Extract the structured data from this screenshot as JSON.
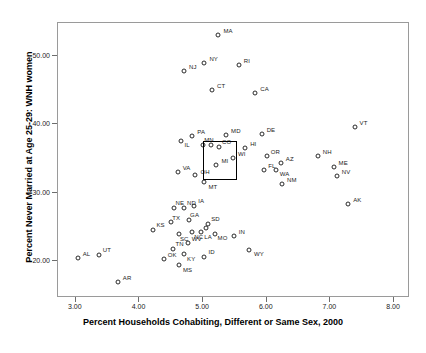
{
  "chart_data": {
    "type": "scatter",
    "title": "",
    "xlabel": "Percent Households Cohabiting, Different or Same Sex, 2000",
    "ylabel": "Percent Never Married at Age 25-29: WNH women",
    "xlim": [
      2.72,
      8.25
    ],
    "ylim": [
      14.6,
      54.8
    ],
    "xticks": [
      "3.00",
      "4.00",
      "5.00",
      "6.00",
      "7.00",
      "8.00"
    ],
    "xtickvalues": [
      3.0,
      4.0,
      5.0,
      6.0,
      7.0,
      8.0
    ],
    "yticks": [
      "20.00",
      "30.00",
      "40.00",
      "50.00"
    ],
    "ytickvalues": [
      20.0,
      30.0,
      40.0,
      50.0
    ],
    "grid": false,
    "legend": null,
    "marker": "open-circle",
    "annotation_box": {
      "label": "highlight-box",
      "x0": 5.0,
      "x1": 5.54,
      "y0": 31.9,
      "y1": 37.6
    },
    "points": [
      {
        "label": "MA",
        "x": 5.24,
        "y": 53.0,
        "lx": 3,
        "ly": -4
      },
      {
        "label": "NY",
        "x": 5.02,
        "y": 49.0,
        "lx": 3,
        "ly": -4
      },
      {
        "label": "NJ",
        "x": 4.7,
        "y": 47.8,
        "lx": 3,
        "ly": -4
      },
      {
        "label": "RI",
        "x": 5.56,
        "y": 48.6,
        "lx": 3,
        "ly": -4
      },
      {
        "label": "CT",
        "x": 5.14,
        "y": 45.0,
        "lx": 3,
        "ly": -4
      },
      {
        "label": "CA",
        "x": 5.82,
        "y": 44.5,
        "lx": 3,
        "ly": -4
      },
      {
        "label": "VT",
        "x": 7.38,
        "y": 39.6,
        "lx": 3,
        "ly": -4
      },
      {
        "label": "PA",
        "x": 4.83,
        "y": 38.3,
        "lx": 3,
        "ly": -4
      },
      {
        "label": "IL",
        "x": 4.66,
        "y": 37.6,
        "lx": 1,
        "ly": 4
      },
      {
        "label": "MD",
        "x": 5.36,
        "y": 38.4,
        "lx": 3,
        "ly": -4
      },
      {
        "label": "DE",
        "x": 5.92,
        "y": 38.6,
        "lx": 3,
        "ly": -4
      },
      {
        "label": "HI",
        "x": 5.66,
        "y": 36.6,
        "lx": 3,
        "ly": -4
      },
      {
        "label": "MN",
        "x": 5.0,
        "y": 36.9,
        "lx": -1,
        "ly": -5
      },
      {
        "label": "CO",
        "x": 5.25,
        "y": 36.7,
        "lx": 1,
        "ly": -5
      },
      {
        "label": "",
        "x": 5.12,
        "y": 37.0,
        "lx": 0,
        "ly": 0
      },
      {
        "label": "WI",
        "x": 5.47,
        "y": 35.1,
        "lx": 3,
        "ly": -4
      },
      {
        "label": "OR",
        "x": 6.0,
        "y": 35.3,
        "lx": 2,
        "ly": -4
      },
      {
        "label": "AZ",
        "x": 6.22,
        "y": 34.4,
        "lx": 3,
        "ly": -4
      },
      {
        "label": "NH",
        "x": 6.8,
        "y": 35.3,
        "lx": 3,
        "ly": -4
      },
      {
        "label": "ME",
        "x": 7.05,
        "y": 33.7,
        "lx": 3,
        "ly": -4
      },
      {
        "label": "NV",
        "x": 7.1,
        "y": 32.5,
        "lx": 3,
        "ly": -4
      },
      {
        "label": "MI",
        "x": 5.21,
        "y": 34.0,
        "lx": 3,
        "ly": -4
      },
      {
        "label": "FL",
        "x": 5.96,
        "y": 33.3,
        "lx": 2,
        "ly": -4
      },
      {
        "label": "WA",
        "x": 6.14,
        "y": 33.3,
        "lx": 2,
        "ly": 4
      },
      {
        "label": "NM",
        "x": 6.24,
        "y": 31.2,
        "lx": 3,
        "ly": -4
      },
      {
        "label": "VA",
        "x": 4.6,
        "y": 33.0,
        "lx": 3,
        "ly": -4
      },
      {
        "label": "OH",
        "x": 4.88,
        "y": 32.6,
        "lx": 3,
        "ly": -3
      },
      {
        "label": "MT",
        "x": 5.02,
        "y": 31.5,
        "lx": 2,
        "ly": 5
      },
      {
        "label": "AK",
        "x": 7.28,
        "y": 28.4,
        "lx": 3,
        "ly": -4
      },
      {
        "label": "NE",
        "x": 4.55,
        "y": 27.7,
        "lx": -1,
        "ly": -5
      },
      {
        "label": "ND",
        "x": 4.7,
        "y": 27.7,
        "lx": 1,
        "ly": -5
      },
      {
        "label": "IA",
        "x": 4.86,
        "y": 28.0,
        "lx": 2,
        "ly": -5
      },
      {
        "label": "GA",
        "x": 4.78,
        "y": 26.0,
        "lx": -1,
        "ly": -5
      },
      {
        "label": "SD",
        "x": 5.08,
        "y": 25.4,
        "lx": 1,
        "ly": -5
      },
      {
        "label": "",
        "x": 5.04,
        "y": 24.8,
        "lx": 0,
        "ly": 0
      },
      {
        "label": "TX",
        "x": 4.5,
        "y": 25.7,
        "lx": -1,
        "ly": -4
      },
      {
        "label": "KS",
        "x": 4.22,
        "y": 24.6,
        "lx": 1,
        "ly": -5
      },
      {
        "label": "SC",
        "x": 4.62,
        "y": 24.0,
        "lx": -1,
        "ly": 5
      },
      {
        "label": "NC",
        "x": 4.83,
        "y": 24.2,
        "lx": 0,
        "ly": 5
      },
      {
        "label": "LA",
        "x": 4.97,
        "y": 24.2,
        "lx": 1,
        "ly": 5
      },
      {
        "label": "MO",
        "x": 5.18,
        "y": 24.0,
        "lx": 1,
        "ly": 4
      },
      {
        "label": "IN",
        "x": 5.48,
        "y": 23.6,
        "lx": 3,
        "ly": -4
      },
      {
        "label": "WY",
        "x": 5.72,
        "y": 21.6,
        "lx": 3,
        "ly": 4
      },
      {
        "label": "WV",
        "x": 4.76,
        "y": 22.6,
        "lx": 2,
        "ly": -4
      },
      {
        "label": "TN",
        "x": 4.52,
        "y": 21.8,
        "lx": 1,
        "ly": -5
      },
      {
        "label": "KY",
        "x": 4.7,
        "y": 21.0,
        "lx": 1,
        "ly": 5
      },
      {
        "label": "ID",
        "x": 5.02,
        "y": 20.6,
        "lx": 2,
        "ly": -5
      },
      {
        "label": "MS",
        "x": 4.62,
        "y": 19.4,
        "lx": 2,
        "ly": 5
      },
      {
        "label": "OK",
        "x": 4.38,
        "y": 20.3,
        "lx": 2,
        "ly": -4
      },
      {
        "label": "AL",
        "x": 3.03,
        "y": 20.5,
        "lx": 3,
        "ly": -4
      },
      {
        "label": "UT",
        "x": 3.36,
        "y": 20.9,
        "lx": 2,
        "ly": -5
      },
      {
        "label": "AR",
        "x": 3.66,
        "y": 16.9,
        "lx": 3,
        "ly": -4
      }
    ]
  }
}
